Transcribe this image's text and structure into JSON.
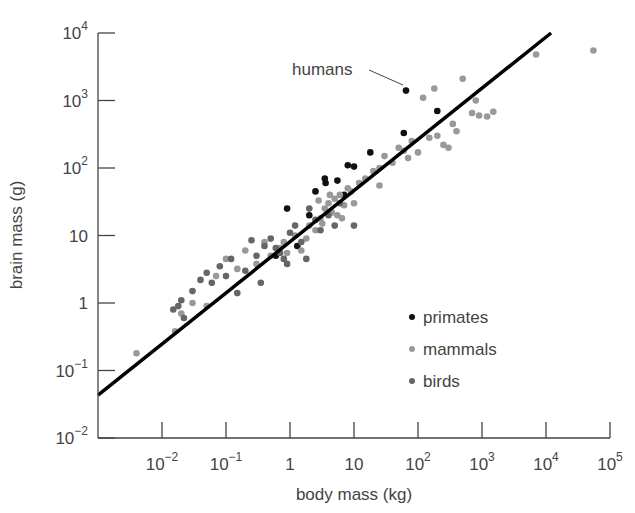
{
  "chart_data": {
    "type": "scatter",
    "title": "",
    "xlabel": "body mass (kg)",
    "ylabel": "brain mass (g)",
    "xscale": "log",
    "yscale": "log",
    "xlim": [
      0.001,
      100000
    ],
    "ylim": [
      0.01,
      10000
    ],
    "x_ticks": [
      {
        "value": 0.01,
        "base": "10",
        "exp": "−2"
      },
      {
        "value": 0.1,
        "base": "10",
        "exp": "−1"
      },
      {
        "value": 1,
        "base": "1",
        "exp": ""
      },
      {
        "value": 10,
        "base": "10",
        "exp": ""
      },
      {
        "value": 100,
        "base": "10",
        "exp": "2"
      },
      {
        "value": 1000,
        "base": "10",
        "exp": "3"
      },
      {
        "value": 10000,
        "base": "10",
        "exp": "4"
      },
      {
        "value": 100000,
        "base": "10",
        "exp": "5"
      }
    ],
    "y_ticks": [
      {
        "value": 10000,
        "base": "10",
        "exp": "4"
      },
      {
        "value": 1000,
        "base": "10",
        "exp": "3"
      },
      {
        "value": 100,
        "base": "10",
        "exp": "2"
      },
      {
        "value": 10,
        "base": "10",
        "exp": ""
      },
      {
        "value": 1,
        "base": "1",
        "exp": ""
      },
      {
        "value": 0.1,
        "base": "10",
        "exp": "−1"
      },
      {
        "value": 0.01,
        "base": "10",
        "exp": "−2"
      }
    ],
    "grid": false,
    "legend_position": "lower right (inside)",
    "annotation": {
      "text": "humans",
      "x": 65,
      "y": 1400
    },
    "fit_line": {
      "x": [
        0.001,
        12000
      ],
      "y": [
        0.043,
        10000
      ],
      "color": "#000000"
    },
    "series": [
      {
        "name": "primates",
        "color": "#111111",
        "points": [
          [
            65,
            1400
          ],
          [
            0.6,
            5
          ],
          [
            0.9,
            25
          ],
          [
            3.5,
            70
          ],
          [
            3.6,
            60
          ],
          [
            5.5,
            65
          ],
          [
            8,
            110
          ],
          [
            10,
            105
          ],
          [
            2,
            20
          ],
          [
            18,
            170
          ],
          [
            60,
            330
          ],
          [
            200,
            700
          ],
          [
            1.3,
            7
          ],
          [
            7,
            40
          ],
          [
            2.5,
            45
          ]
        ]
      },
      {
        "name": "mammals",
        "color": "#999999",
        "points": [
          [
            0.004,
            0.18
          ],
          [
            0.016,
            0.38
          ],
          [
            0.02,
            0.7
          ],
          [
            0.03,
            1.0
          ],
          [
            0.05,
            0.9
          ],
          [
            0.07,
            2.5
          ],
          [
            0.1,
            4.5
          ],
          [
            0.15,
            3.2
          ],
          [
            0.2,
            6
          ],
          [
            0.3,
            3.8
          ],
          [
            0.4,
            8
          ],
          [
            0.5,
            5
          ],
          [
            0.7,
            6.5
          ],
          [
            0.9,
            5.5
          ],
          [
            1.2,
            10
          ],
          [
            1.5,
            6
          ],
          [
            2,
            14
          ],
          [
            2.5,
            12
          ],
          [
            3,
            18
          ],
          [
            3.5,
            25
          ],
          [
            4,
            30
          ],
          [
            4.5,
            22
          ],
          [
            5,
            35
          ],
          [
            5.5,
            20
          ],
          [
            6,
            40
          ],
          [
            7,
            28
          ],
          [
            8,
            50
          ],
          [
            9,
            45
          ],
          [
            10,
            30
          ],
          [
            12,
            60
          ],
          [
            15,
            70
          ],
          [
            20,
            90
          ],
          [
            25,
            100
          ],
          [
            25,
            55
          ],
          [
            30,
            150
          ],
          [
            40,
            120
          ],
          [
            50,
            200
          ],
          [
            60,
            180
          ],
          [
            70,
            140
          ],
          [
            80,
            250
          ],
          [
            100,
            170
          ],
          [
            120,
            1100
          ],
          [
            150,
            280
          ],
          [
            180,
            1500
          ],
          [
            200,
            300
          ],
          [
            250,
            220
          ],
          [
            300,
            200
          ],
          [
            350,
            450
          ],
          [
            400,
            350
          ],
          [
            500,
            2100
          ],
          [
            700,
            650
          ],
          [
            800,
            1000
          ],
          [
            900,
            600
          ],
          [
            1200,
            580
          ],
          [
            1500,
            680
          ],
          [
            7000,
            4800
          ],
          [
            55000,
            5500
          ],
          [
            0.8,
            8
          ],
          [
            1.8,
            9
          ],
          [
            3.2,
            15
          ],
          [
            4.2,
            40
          ],
          [
            6.5,
            18
          ],
          [
            2.8,
            33
          ]
        ]
      },
      {
        "name": "birds",
        "color": "#666666",
        "points": [
          [
            0.015,
            0.8
          ],
          [
            0.018,
            0.9
          ],
          [
            0.02,
            1.1
          ],
          [
            0.022,
            0.6
          ],
          [
            0.03,
            1.5
          ],
          [
            0.04,
            2.2
          ],
          [
            0.05,
            2.8
          ],
          [
            0.06,
            2.0
          ],
          [
            0.08,
            3.5
          ],
          [
            0.1,
            2.5
          ],
          [
            0.12,
            4.5
          ],
          [
            0.15,
            1.4
          ],
          [
            0.2,
            3.0
          ],
          [
            0.25,
            8.5
          ],
          [
            0.3,
            5
          ],
          [
            0.35,
            2.0
          ],
          [
            0.4,
            7
          ],
          [
            0.5,
            9
          ],
          [
            0.6,
            6.5
          ],
          [
            0.7,
            5.5
          ],
          [
            0.8,
            4.5
          ],
          [
            1.0,
            11
          ],
          [
            1.2,
            14
          ],
          [
            1.5,
            8
          ],
          [
            2.0,
            25
          ],
          [
            2.5,
            17
          ],
          [
            3.0,
            12
          ],
          [
            4.0,
            20
          ],
          [
            5.0,
            14
          ],
          [
            6.0,
            30
          ],
          [
            10,
            14
          ],
          [
            0.9,
            3.8
          ],
          [
            1.8,
            4.5
          ]
        ]
      }
    ]
  },
  "legend": {
    "items": [
      {
        "label": "primates",
        "color": "#111111"
      },
      {
        "label": "mammals",
        "color": "#999999"
      },
      {
        "label": "birds",
        "color": "#666666"
      }
    ]
  }
}
